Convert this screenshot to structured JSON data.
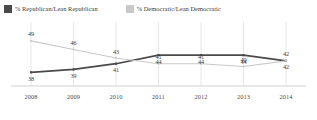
{
  "legend": {
    "entries": [
      {
        "label": "% Republican/Lean Republican",
        "color": "#4a4a4a",
        "key": "republican"
      },
      {
        "label": "% Democratic/Lean Democratic",
        "color": "#c9c9c9",
        "key": "democratic"
      }
    ]
  },
  "chart_data": {
    "type": "line",
    "title": "",
    "subtitle": "",
    "xlabel": "",
    "ylabel": "",
    "categories": [
      "2008",
      "2009",
      "2010",
      "2011",
      "2012",
      "2013",
      "2014"
    ],
    "x": [
      2008,
      2009,
      2010,
      2011,
      2012,
      2013,
      2014
    ],
    "ylim": [
      36,
      50
    ],
    "grid": "vertical",
    "legend_position": "top-left",
    "series": [
      {
        "name": "% Republican/Lean Republican",
        "color": "#4a4a4a",
        "values": [
          38,
          39,
          41,
          44,
          44,
          44,
          42
        ],
        "label_position": "below"
      },
      {
        "name": "% Democratic/Lean Democratic",
        "color": "#c9c9c9",
        "values": [
          49,
          46,
          43,
          41,
          41,
          40,
          42
        ],
        "label_position": "above"
      }
    ]
  }
}
